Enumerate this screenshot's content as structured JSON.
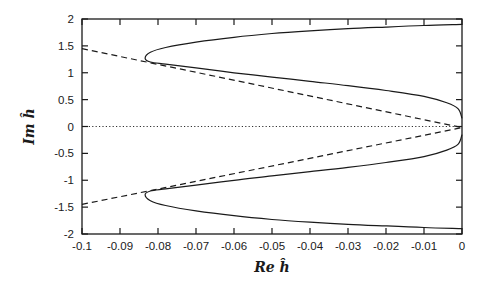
{
  "chart_data": {
    "type": "line",
    "title": "",
    "xlabel": "Re ĥ",
    "ylabel": "Im ĥ",
    "xlim": [
      -0.1,
      0
    ],
    "ylim": [
      -2,
      2
    ],
    "grid": false,
    "legend": "none",
    "xticks": [
      -0.1,
      -0.09,
      -0.08,
      -0.07,
      -0.06,
      -0.05,
      -0.04,
      -0.03,
      -0.02,
      -0.01,
      0
    ],
    "xtick_labels": [
      "-0.1",
      "-0.09",
      "-0.08",
      "-0.07",
      "-0.06",
      "-0.05",
      "-0.04",
      "-0.03",
      "-0.02",
      "-0.01",
      "0"
    ],
    "yticks": [
      -2,
      -1.5,
      -1,
      -0.5,
      0,
      0.5,
      1,
      1.5,
      2
    ],
    "ytick_labels": [
      "-2",
      "-1.5",
      "-1",
      "-0.5",
      "0",
      "0.5",
      "1",
      "1.5",
      "2"
    ],
    "series": [
      {
        "name": "upper-solid-curve",
        "style": "solid",
        "x": [
          0,
          -0.01,
          -0.02,
          -0.03,
          -0.04,
          -0.05,
          -0.06,
          -0.07,
          -0.078,
          -0.082,
          -0.0834,
          -0.082,
          -0.078,
          -0.07,
          -0.06,
          -0.05,
          -0.04,
          -0.03,
          -0.02,
          -0.01,
          -0.004,
          -0.001,
          0
        ],
        "y": [
          1.9,
          1.88,
          1.85,
          1.82,
          1.78,
          1.73,
          1.66,
          1.57,
          1.47,
          1.38,
          1.27,
          1.2,
          1.16,
          1.09,
          1.0,
          0.92,
          0.84,
          0.76,
          0.67,
          0.56,
          0.44,
          0.33,
          0.15
        ]
      },
      {
        "name": "lower-solid-curve",
        "style": "solid",
        "x": [
          0,
          -0.01,
          -0.02,
          -0.03,
          -0.04,
          -0.05,
          -0.06,
          -0.07,
          -0.078,
          -0.082,
          -0.0834,
          -0.082,
          -0.078,
          -0.07,
          -0.06,
          -0.05,
          -0.04,
          -0.03,
          -0.02,
          -0.01,
          -0.004,
          -0.001,
          0
        ],
        "y": [
          -1.9,
          -1.88,
          -1.85,
          -1.82,
          -1.78,
          -1.73,
          -1.66,
          -1.57,
          -1.47,
          -1.38,
          -1.27,
          -1.2,
          -1.16,
          -1.09,
          -1.0,
          -0.92,
          -0.84,
          -0.76,
          -0.67,
          -0.56,
          -0.44,
          -0.33,
          -0.15
        ]
      },
      {
        "name": "upper-dashed-line",
        "style": "dashed",
        "x": [
          -0.1,
          0
        ],
        "y": [
          1.45,
          -0.02
        ]
      },
      {
        "name": "lower-dashed-line",
        "style": "dashed",
        "x": [
          -0.1,
          0
        ],
        "y": [
          -1.45,
          -0.02
        ]
      },
      {
        "name": "zero-dotted-line",
        "style": "dotted",
        "x": [
          -0.1,
          0
        ],
        "y": [
          0,
          0
        ]
      }
    ]
  }
}
